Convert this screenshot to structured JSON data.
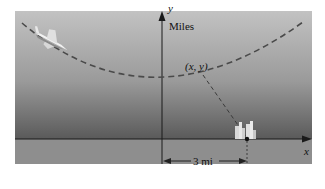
{
  "figure": {
    "y_axis_label": "y",
    "y_axis_units": "Miles",
    "x_axis_label": "x",
    "point_label": "(x, y)",
    "distance_label": "3 mi"
  },
  "colors": {
    "sky_top": "#bdbdbd",
    "sky_bottom": "#5e5e5e",
    "ground": "#8f8f8f",
    "curve": "#4a4a4a",
    "axis": "#1a1a1a"
  },
  "elements": {
    "path": "parabolic dashed flight path",
    "aircraft": "jet fighter",
    "target": "city buildings at (3, 0)"
  }
}
